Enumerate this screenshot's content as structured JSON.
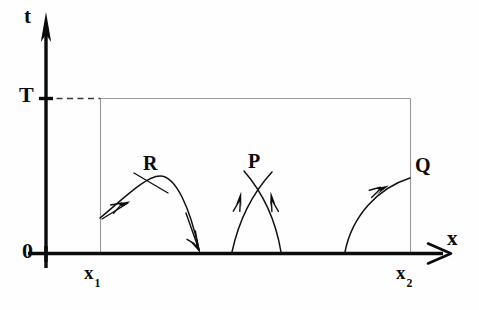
{
  "figure": {
    "type": "spacetime-diagram",
    "title": "",
    "background_color": "#fefefe",
    "ink_color": "#0b0b0b",
    "guide_color": "#9a9a9a",
    "width": 479,
    "height": 310
  },
  "axes": {
    "vertical": {
      "name": "t-axis",
      "label": "t",
      "arrow": "up",
      "origin_label": "0"
    },
    "horizontal": {
      "name": "x-axis",
      "label": "x",
      "arrow": "right"
    }
  },
  "ticks": {
    "time_level": {
      "label": "T",
      "dashed_guide": true
    },
    "left_boundary": {
      "label_base": "x",
      "label_sub": "1"
    },
    "right_boundary": {
      "label_base": "x",
      "label_sub": "2"
    }
  },
  "region": {
    "name": "causal-diamond-box",
    "description": "rectangle bounded by x1, x2 and t = T"
  },
  "curves": [
    {
      "id": "R",
      "label": "R",
      "description": "arc starting on the left boundary x1, rising over and descending to the x-axis, with two direction arrows and a crossing tick at R"
    },
    {
      "id": "P",
      "label": "P",
      "description": "two arcs rising from the x-axis crossing at point P, each with an upward arrow"
    },
    {
      "id": "Q",
      "label": "Q",
      "description": "arc rising from the x-axis to the right boundary x2, with an upward-right arrow, meeting at Q"
    }
  ]
}
